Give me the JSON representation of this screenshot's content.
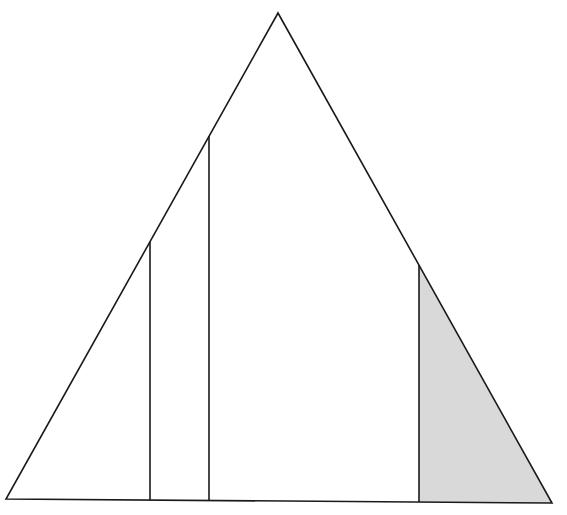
{
  "diagram": {
    "type": "triangle-partition",
    "canvas": {
      "width": 567,
      "height": 515
    },
    "colors": {
      "background": "#ffffff",
      "stroke": "#1a1a1a",
      "shaded_fill": "#d9d9d9"
    },
    "stroke_width": 1.6,
    "triangle": {
      "apex": [
        278,
        13
      ],
      "bottom_left": [
        6,
        499
      ],
      "bottom_right": [
        552,
        503
      ]
    },
    "vertical_lines": [
      {
        "x": 150,
        "top_y": 242,
        "bottom_y": 500,
        "edge": "left"
      },
      {
        "x": 209,
        "top_y": 136,
        "bottom_y": 500.5,
        "edge": "left"
      },
      {
        "x": 419,
        "top_y": 265,
        "bottom_y": 502,
        "edge": "right"
      }
    ],
    "shaded_region": {
      "description": "region right of the rightmost vertical line, bounded by right edge and base",
      "points": [
        [
          419,
          265
        ],
        [
          552,
          503
        ],
        [
          419,
          502
        ]
      ]
    }
  }
}
